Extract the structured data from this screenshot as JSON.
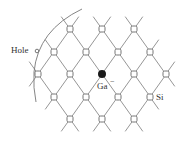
{
  "diagram": {
    "labels": {
      "hole": "Hole",
      "gallium": "Ga",
      "gallium_charge": "−",
      "silicon": "Si"
    },
    "colors": {
      "bond": "#8a8a8a",
      "atom_stroke": "#666666",
      "ga_fill": "#1a1a1a",
      "arc": "#777777"
    },
    "nodes": [
      {
        "x": 70,
        "y": 29
      },
      {
        "x": 102,
        "y": 29
      },
      {
        "x": 134,
        "y": 29
      },
      {
        "x": 54,
        "y": 52
      },
      {
        "x": 86,
        "y": 52
      },
      {
        "x": 118,
        "y": 52
      },
      {
        "x": 150,
        "y": 52
      },
      {
        "x": 38,
        "y": 74
      },
      {
        "x": 70,
        "y": 74
      },
      {
        "x": 102,
        "y": 74,
        "type": "Ga"
      },
      {
        "x": 134,
        "y": 74
      },
      {
        "x": 166,
        "y": 74
      },
      {
        "x": 54,
        "y": 97
      },
      {
        "x": 86,
        "y": 97
      },
      {
        "x": 118,
        "y": 97
      },
      {
        "x": 150,
        "y": 97,
        "type": "Si-labeled"
      },
      {
        "x": 70,
        "y": 119
      },
      {
        "x": 102,
        "y": 119
      },
      {
        "x": 134,
        "y": 119
      }
    ]
  }
}
